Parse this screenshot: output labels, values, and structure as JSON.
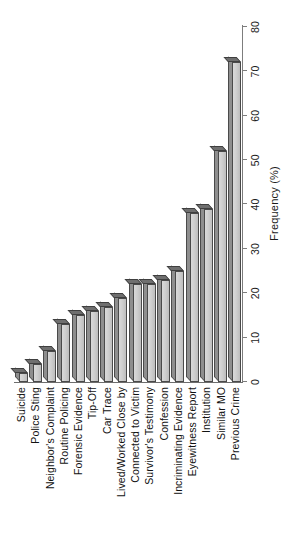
{
  "chart_data": {
    "type": "bar",
    "orientation": "horizontal",
    "title": "",
    "subtitle": "",
    "xlabel": "Frequency (%)",
    "ylabel": "",
    "xlim": [
      0,
      80
    ],
    "xticks": [
      0,
      10,
      20,
      30,
      40,
      50,
      60,
      70,
      80
    ],
    "xtick_labels": [
      "0",
      "10",
      "20",
      "30",
      "40",
      "50",
      "60",
      "70",
      "80"
    ],
    "grid": false,
    "legend": null,
    "legend_position": "none",
    "categories": [
      "Suicide",
      "Police Sting",
      "Neighbor's Complaint",
      "Routine Policing",
      "Forensic Evidence",
      "Tip-Off",
      "Car Trace",
      "Lived/Worked Close by",
      "Connected to Victim",
      "Survivor's Testimony",
      "Confession",
      "Incriminating Evidence",
      "Eyewitness Report",
      "Institution",
      "Similar MO",
      "Previous Crime"
    ],
    "values": [
      2,
      4,
      7,
      13,
      15,
      16,
      17,
      19,
      22,
      22,
      23,
      25,
      38,
      39,
      52,
      72
    ],
    "bar_face_color": "#cfcfcf",
    "bar_shade_color": "#8e8e8e",
    "bar_edge_color": "#4a4a4a",
    "axis_color": "#7d7d7d",
    "text_color": "#121212",
    "background_color": "#ffffff"
  },
  "axis": {
    "value_axis_title": "Frequency (%)"
  }
}
